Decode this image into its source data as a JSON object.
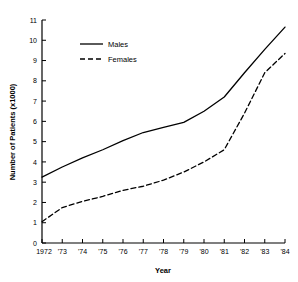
{
  "chart_data": {
    "type": "line",
    "title": "",
    "xlabel": "Year",
    "ylabel": "Number of Patients  (x1000)",
    "x": [
      1972,
      1973,
      1974,
      1975,
      1976,
      1977,
      1978,
      1979,
      1980,
      1981,
      1982,
      1983,
      1984
    ],
    "xtick_labels": [
      "1972",
      "'73",
      "'74",
      "'75",
      "'76",
      "'77",
      "'78",
      "'79",
      "'80",
      "'81",
      "'82",
      "'83",
      "'84"
    ],
    "ytick_labels": [
      "0",
      "1",
      "2",
      "3",
      "4",
      "5",
      "6",
      "7",
      "8",
      "9",
      "10",
      "11"
    ],
    "ytick_values": [
      0,
      1,
      2,
      3,
      4,
      5,
      6,
      7,
      8,
      9,
      10,
      11
    ],
    "xlim": [
      1972,
      1984
    ],
    "ylim": [
      0,
      11
    ],
    "grid": false,
    "legend_position": "upper-left-inside",
    "series": [
      {
        "name": "Males",
        "style": "solid",
        "color": "#000000",
        "values": [
          3.25,
          3.75,
          4.2,
          4.6,
          5.05,
          5.45,
          5.7,
          5.95,
          6.5,
          7.2,
          8.4,
          9.55,
          10.65
        ]
      },
      {
        "name": "Females",
        "style": "dashed",
        "color": "#000000",
        "values": [
          1.05,
          1.75,
          2.05,
          2.3,
          2.6,
          2.8,
          3.1,
          3.5,
          4.0,
          4.6,
          6.4,
          8.4,
          9.35
        ]
      }
    ]
  },
  "legend": {
    "items": [
      {
        "label": "Males",
        "style": "solid"
      },
      {
        "label": "Females",
        "style": "dashed"
      }
    ]
  }
}
